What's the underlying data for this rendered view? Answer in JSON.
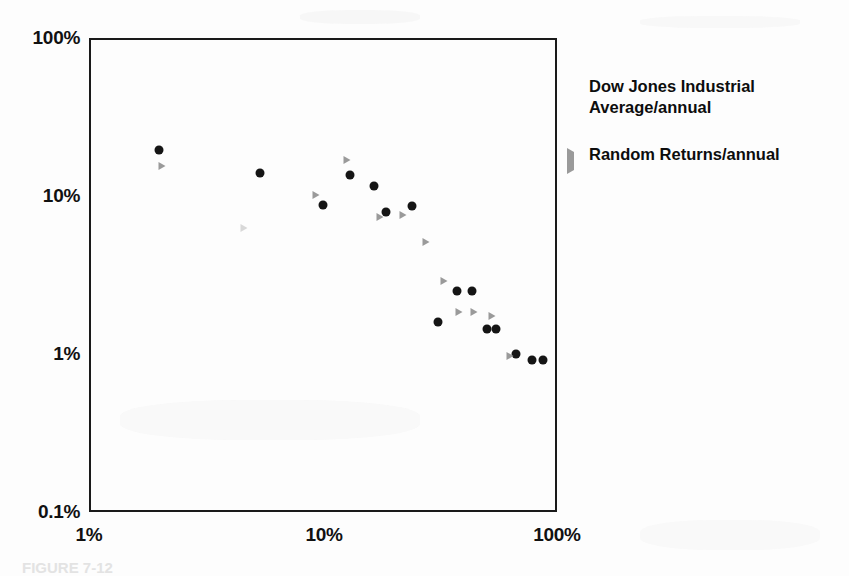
{
  "figure": {
    "caption": "FIGURE 7-12",
    "background_color": "#fdfdfd",
    "frame_color": "#1a1a1a"
  },
  "legend": {
    "position": "right",
    "entries": [
      {
        "label": "Dow Jones Industrial Average/annual",
        "marker": "dot-icon",
        "color": "#151515"
      },
      {
        "label": "Random Returns/annual",
        "marker": "triangle-right-icon",
        "color": "#9a9a9a"
      }
    ]
  },
  "axes": {
    "x": {
      "labels": [
        "1%",
        "10%",
        "100%"
      ],
      "scale": "log",
      "min": 1,
      "max": 100
    },
    "y": {
      "labels": [
        "100%",
        "10%",
        "1%",
        "0.1%"
      ],
      "scale": "log",
      "min": 0.1,
      "max": 100
    }
  },
  "chart_data": {
    "type": "scatter",
    "title": "",
    "subtitle": "",
    "xlabel": "",
    "ylabel": "",
    "xscale": "log",
    "yscale": "log",
    "xlim": [
      1,
      100
    ],
    "ylim": [
      0.1,
      100
    ],
    "xticks": [
      1,
      10,
      100
    ],
    "xticklabels": [
      "1%",
      "10%",
      "100%"
    ],
    "yticks": [
      0.1,
      1,
      10,
      100
    ],
    "yticklabels": [
      "0.1%",
      "1%",
      "10%",
      "100%"
    ],
    "grid": false,
    "legend_position": "right",
    "series": [
      {
        "name": "Dow Jones Industrial Average/annual",
        "marker": "circle",
        "color": "#151515",
        "points": [
          {
            "x": 2.0,
            "y": 19.5
          },
          {
            "x": 5.4,
            "y": 14.0
          },
          {
            "x": 10.0,
            "y": 8.8
          },
          {
            "x": 13.0,
            "y": 13.5
          },
          {
            "x": 16.5,
            "y": 11.6
          },
          {
            "x": 18.5,
            "y": 7.9
          },
          {
            "x": 24.0,
            "y": 8.7
          },
          {
            "x": 31.0,
            "y": 1.6
          },
          {
            "x": 37.5,
            "y": 2.5
          },
          {
            "x": 43.5,
            "y": 2.5
          },
          {
            "x": 50.0,
            "y": 1.45
          },
          {
            "x": 55.0,
            "y": 1.45
          },
          {
            "x": 67.0,
            "y": 1.0
          },
          {
            "x": 78.0,
            "y": 0.92
          },
          {
            "x": 87.0,
            "y": 0.92
          }
        ]
      },
      {
        "name": "Random Returns/annual",
        "marker": "triangle",
        "color": "#9a9a9a",
        "points": [
          {
            "x": 2.05,
            "y": 15.5
          },
          {
            "x": 4.6,
            "y": 6.3
          },
          {
            "x": 9.3,
            "y": 10.2
          },
          {
            "x": 12.7,
            "y": 16.8
          },
          {
            "x": 17.6,
            "y": 7.4
          },
          {
            "x": 22.0,
            "y": 7.6
          },
          {
            "x": 27.5,
            "y": 5.1
          },
          {
            "x": 33.0,
            "y": 2.9
          },
          {
            "x": 38.0,
            "y": 1.85
          },
          {
            "x": 44.0,
            "y": 1.85
          },
          {
            "x": 53.0,
            "y": 1.75
          },
          {
            "x": 63.0,
            "y": 0.97
          }
        ]
      }
    ]
  }
}
